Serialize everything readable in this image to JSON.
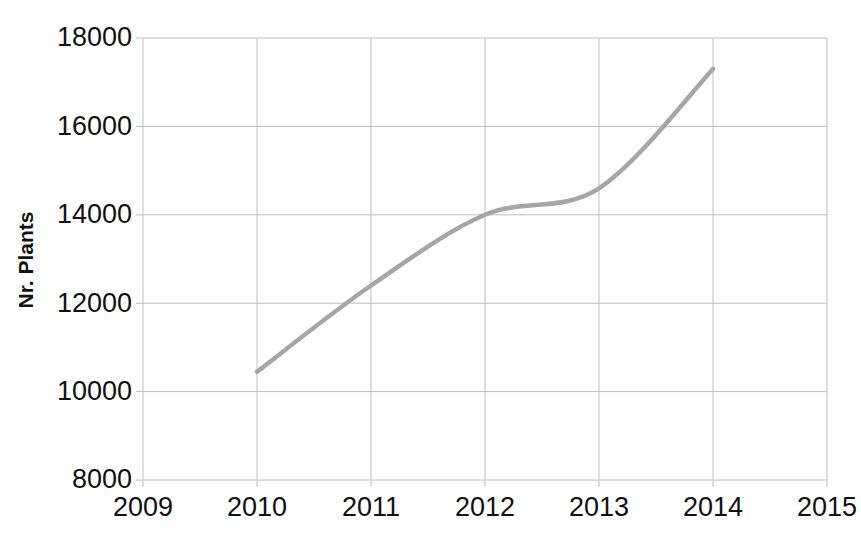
{
  "chart_data": {
    "type": "line",
    "title": "",
    "xlabel": "",
    "ylabel": "Nr. Plants",
    "x": [
      2010,
      2011,
      2012,
      2013,
      2014
    ],
    "values": [
      10450,
      12400,
      14000,
      14600,
      17300
    ],
    "series": [
      {
        "name": "Nr. Plants",
        "x": [
          2010,
          2011,
          2012,
          2013,
          2014
        ],
        "values": [
          10450,
          12400,
          14000,
          14600,
          17300
        ]
      }
    ],
    "xlim": [
      2009,
      2015
    ],
    "ylim": [
      8000,
      18000
    ],
    "xticks": [
      2009,
      2010,
      2011,
      2012,
      2013,
      2014,
      2015
    ],
    "xtick_labels": [
      "2009",
      "2010",
      "2011",
      "2012",
      "2013",
      "2014",
      "2015"
    ],
    "yticks": [
      8000,
      10000,
      12000,
      14000,
      16000,
      18000
    ],
    "ytick_labels": [
      "8000",
      "10000",
      "12000",
      "14000",
      "16000",
      "18000"
    ],
    "grid": true,
    "legend": null,
    "line_color": "#a6a6a6",
    "grid_color": "#bfbfbf",
    "axis_color": "#bfbfbf",
    "smoothing": "spline"
  },
  "axis": {
    "y_title": "Nr. Plants"
  }
}
